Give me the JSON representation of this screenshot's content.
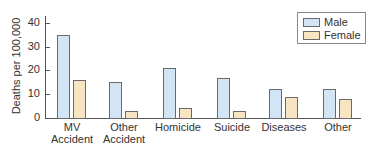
{
  "chart_data": {
    "type": "bar",
    "title": "",
    "xlabel": "",
    "ylabel": "Deaths per 100,000",
    "ylim": [
      0,
      45
    ],
    "yticks": [
      0,
      10,
      20,
      30,
      40
    ],
    "grid": false,
    "legend_position": "upper right",
    "categories": [
      "MV Accident",
      "Other Accident",
      "Homicide",
      "Suicide",
      "Diseases",
      "Other"
    ],
    "category_lines": [
      [
        "MV",
        "Accident"
      ],
      [
        "Other",
        "Accident"
      ],
      [
        "Homicide",
        ""
      ],
      [
        "Suicide",
        ""
      ],
      [
        "Diseases",
        ""
      ],
      [
        "Other",
        ""
      ]
    ],
    "series": [
      {
        "name": "Male",
        "color": "#d3e4f4",
        "values": [
          35,
          15,
          21,
          17,
          12,
          12
        ]
      },
      {
        "name": "Female",
        "color": "#f6e5c0",
        "values": [
          16,
          3,
          4,
          3,
          9,
          8
        ]
      }
    ]
  },
  "legend": {
    "male_label": "Male",
    "female_label": "Female"
  },
  "axis": {
    "ylabel": "Deaths per 100,000",
    "ticks": [
      "0",
      "10",
      "20",
      "30",
      "40"
    ]
  }
}
